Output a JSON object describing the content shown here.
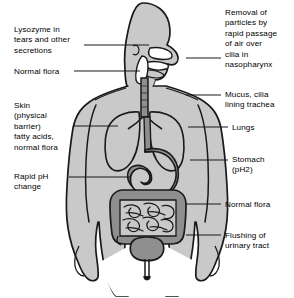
{
  "diagram": {
    "figure_name": "human-body-anatomy-silhouette",
    "colors": {
      "body_fill": "#c9c9c9",
      "organ_fill": "#8f8f8f",
      "outline": "#1a1a1a",
      "background": "#ffffff",
      "leader_line": "#1a1a1a",
      "text": "#000000"
    },
    "labels_left": [
      {
        "name": "lysozyme-label",
        "text": "Lysozyme in\ntears and other\nsecretions",
        "x": 14,
        "y": 25,
        "leader": {
          "x1": 84,
          "y1": 45,
          "x2": 149,
          "y2": 45
        }
      },
      {
        "name": "normal-flora-upper-label",
        "text": "Normal flora",
        "x": 14,
        "y": 67,
        "leader": {
          "x1": 74,
          "y1": 71,
          "x2": 140,
          "y2": 71
        }
      },
      {
        "name": "skin-label",
        "text": "Skin\n(physical\nbarrier)\nfatty acids,\nnormal flora",
        "x": 14,
        "y": 101,
        "leader": {
          "x1": 74,
          "y1": 126,
          "x2": 118,
          "y2": 126
        }
      },
      {
        "name": "rapid-ph-change-label",
        "text": "Rapid pH\nchange",
        "x": 14,
        "y": 172,
        "leader": {
          "x1": 69,
          "y1": 177,
          "x2": 131,
          "y2": 177
        }
      }
    ],
    "labels_right": [
      {
        "name": "nasopharynx-cilia-label",
        "text": "Removal of\nparticles by\nrapid passage\nof air over\ncilia in\nnasopharynx",
        "x": 225,
        "y": 8,
        "leader": {
          "x1": 186,
          "y1": 58,
          "x2": 221,
          "y2": 58
        }
      },
      {
        "name": "mucus-cilia-trachea-label",
        "text": "Mucus, cilia\nlining trachea",
        "x": 225,
        "y": 90,
        "leader": {
          "x1": 186,
          "y1": 95,
          "x2": 221,
          "y2": 95
        }
      },
      {
        "name": "lungs-label",
        "text": "Lungs",
        "x": 232,
        "y": 123,
        "leader": {
          "x1": 188,
          "y1": 127,
          "x2": 228,
          "y2": 127
        }
      },
      {
        "name": "stomach-ph2-label",
        "text": "Stomach\n(pH2)",
        "x": 232,
        "y": 155,
        "leader": {
          "x1": 190,
          "y1": 160,
          "x2": 228,
          "y2": 160
        }
      },
      {
        "name": "normal-flora-intestine-label",
        "text": "Normal flora",
        "x": 225,
        "y": 200,
        "leader": {
          "x1": 186,
          "y1": 204,
          "x2": 221,
          "y2": 204
        }
      },
      {
        "name": "flushing-urinary-tract-label",
        "text": "Flushing of\nurinary tract",
        "x": 225,
        "y": 231,
        "leader": {
          "x1": 186,
          "y1": 235,
          "x2": 221,
          "y2": 235
        }
      }
    ]
  }
}
